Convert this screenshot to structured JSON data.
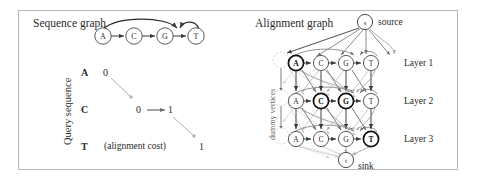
{
  "figure": {
    "panels": {
      "left": {
        "title": "Sequence graph",
        "axis_label": "Query sequence",
        "sequence_nodes": [
          {
            "label": "A"
          },
          {
            "label": "C"
          },
          {
            "label": "G"
          },
          {
            "label": "T"
          }
        ],
        "query_rows": [
          {
            "letter": "A",
            "cost": "0"
          },
          {
            "letter": "C",
            "cost_left": "0",
            "cost_right": "1"
          },
          {
            "letter": "T",
            "note": "(alignment cost)",
            "cost": "1"
          }
        ]
      },
      "right": {
        "title": "Alignment graph",
        "source_node": "s",
        "source_label": "source",
        "sink_node": "t",
        "sink_label": "sink",
        "dummy_label": "dummy vertices",
        "layers": [
          {
            "name": "Layer 1",
            "nodes": [
              "A",
              "C",
              "G",
              "T"
            ],
            "highlighted": "A"
          },
          {
            "name": "Layer 2",
            "nodes": [
              "A",
              "C",
              "G",
              "T"
            ],
            "highlighted": "C"
          },
          {
            "name": "Layer 3",
            "nodes": [
              "A",
              "C",
              "G",
              "T"
            ],
            "highlighted": "T"
          }
        ],
        "extra_highlighted": "G"
      }
    },
    "colors": {
      "frame": "#b8b8b8",
      "node_stroke": "#4a4a4a",
      "node_stroke_bold": "#1a1a1a",
      "edge_dark": "#3a3a3a",
      "edge_light": "#a8a8a8",
      "edge_faint": "#cccccc",
      "dummy_stroke": "#c4c4c4",
      "text": "#2b2b2b",
      "background": "#ffffff"
    }
  }
}
